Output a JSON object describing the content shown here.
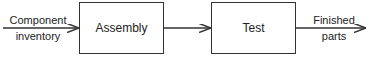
{
  "diagram": {
    "type": "flow",
    "nodes": [
      {
        "id": "assembly",
        "label": "Assembly"
      },
      {
        "id": "test",
        "label": "Test"
      }
    ],
    "input_label_line1": "Component",
    "input_label_line2": "inventory",
    "output_label_line1": "Finished",
    "output_label_line2": "parts",
    "edges": [
      {
        "from": "Component inventory",
        "to": "assembly"
      },
      {
        "from": "assembly",
        "to": "test"
      },
      {
        "from": "test",
        "to": "Finished parts"
      }
    ]
  }
}
